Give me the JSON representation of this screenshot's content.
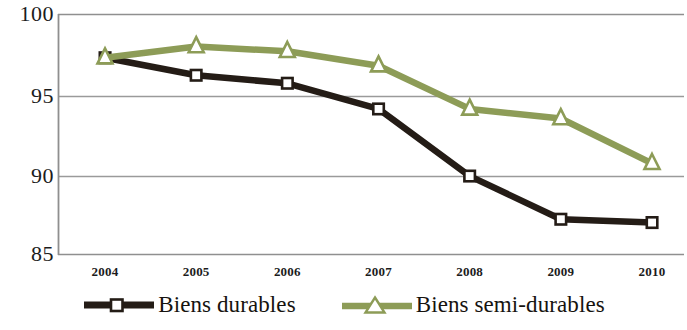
{
  "chart_data": {
    "type": "line",
    "title": "",
    "subtitle": "",
    "xlabel": "",
    "ylabel": "",
    "categories": [
      "2004",
      "2005",
      "2006",
      "2007",
      "2008",
      "2009",
      "2010"
    ],
    "x": [
      2004,
      2005,
      2006,
      2007,
      2008,
      2009,
      2010
    ],
    "ylim": [
      85,
      100
    ],
    "yticks": [
      85,
      90,
      95,
      100
    ],
    "ytick_labels": [
      "85",
      "90",
      "95",
      "100"
    ],
    "grid": "horizontal",
    "legend_position": "bottom",
    "series": [
      {
        "name": "Biens durables",
        "color": "#241c16",
        "marker": "square",
        "marker_fill": "#ffffff",
        "values": [
          97.3,
          96.2,
          95.7,
          94.1,
          89.9,
          87.2,
          87.0
        ]
      },
      {
        "name": "Biens semi-durables",
        "color": "#8d9c57",
        "marker": "triangle",
        "marker_fill": "#ffffff",
        "values": [
          97.3,
          98.0,
          97.7,
          96.8,
          94.1,
          93.5,
          90.7
        ]
      }
    ],
    "axis_color": "#8f8f8f",
    "grid_color": "#9a9a9a",
    "background": "#ffffff"
  },
  "legend": {
    "entries": [
      {
        "label": "Biens durables",
        "color": "#241c16",
        "marker": "square"
      },
      {
        "label": "Biens semi-durables",
        "color": "#8d9c57",
        "marker": "triangle"
      }
    ]
  }
}
